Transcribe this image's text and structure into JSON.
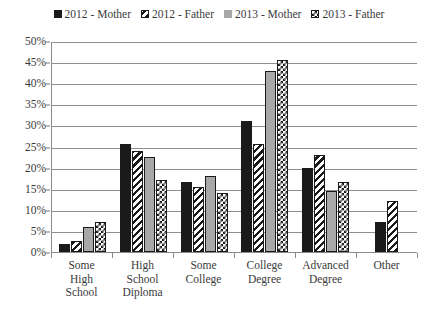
{
  "chart_data": {
    "type": "bar",
    "title": "",
    "xlabel": "",
    "ylabel": "",
    "ylim": [
      0,
      50
    ],
    "ytick_step": 5,
    "grid": true,
    "legend_position": "top",
    "categories": [
      "Some High School",
      "High School Diploma",
      "Some College",
      "College Degree",
      "Advanced Degree",
      "Other"
    ],
    "category_lines": [
      [
        "Some",
        "High",
        "School"
      ],
      [
        "High",
        "School",
        "Diploma"
      ],
      [
        "Some",
        "College"
      ],
      [
        "College",
        "Degree"
      ],
      [
        "Advanced",
        "Degree"
      ],
      [
        "Other"
      ]
    ],
    "ytick_labels": [
      "50%",
      "45%",
      "40%",
      "35%",
      "30%",
      "25%",
      "20%",
      "15%",
      "10%",
      "5%",
      "0%"
    ],
    "ytick_values": [
      50,
      45,
      40,
      35,
      30,
      25,
      20,
      15,
      10,
      5,
      0
    ],
    "series": [
      {
        "name": "2012 - Mother",
        "pattern": "solid-black",
        "color": "#1a1a1a",
        "values": [
          2,
          25.5,
          16.5,
          31,
          20,
          7
        ]
      },
      {
        "name": "2012 - Father",
        "pattern": "diagonal-stripe",
        "color": "#1a1a1a",
        "values": [
          2.5,
          24,
          15.5,
          25.5,
          23,
          12
        ]
      },
      {
        "name": "2013 - Mother",
        "pattern": "solid-gray",
        "color": "#a8a8a8",
        "values": [
          6,
          22.5,
          18,
          43,
          14.5,
          0
        ]
      },
      {
        "name": "2013 - Father",
        "pattern": "checkerboard",
        "color": "#1a1a1a",
        "values": [
          7,
          17,
          14,
          45.5,
          16.5,
          0
        ]
      }
    ]
  }
}
